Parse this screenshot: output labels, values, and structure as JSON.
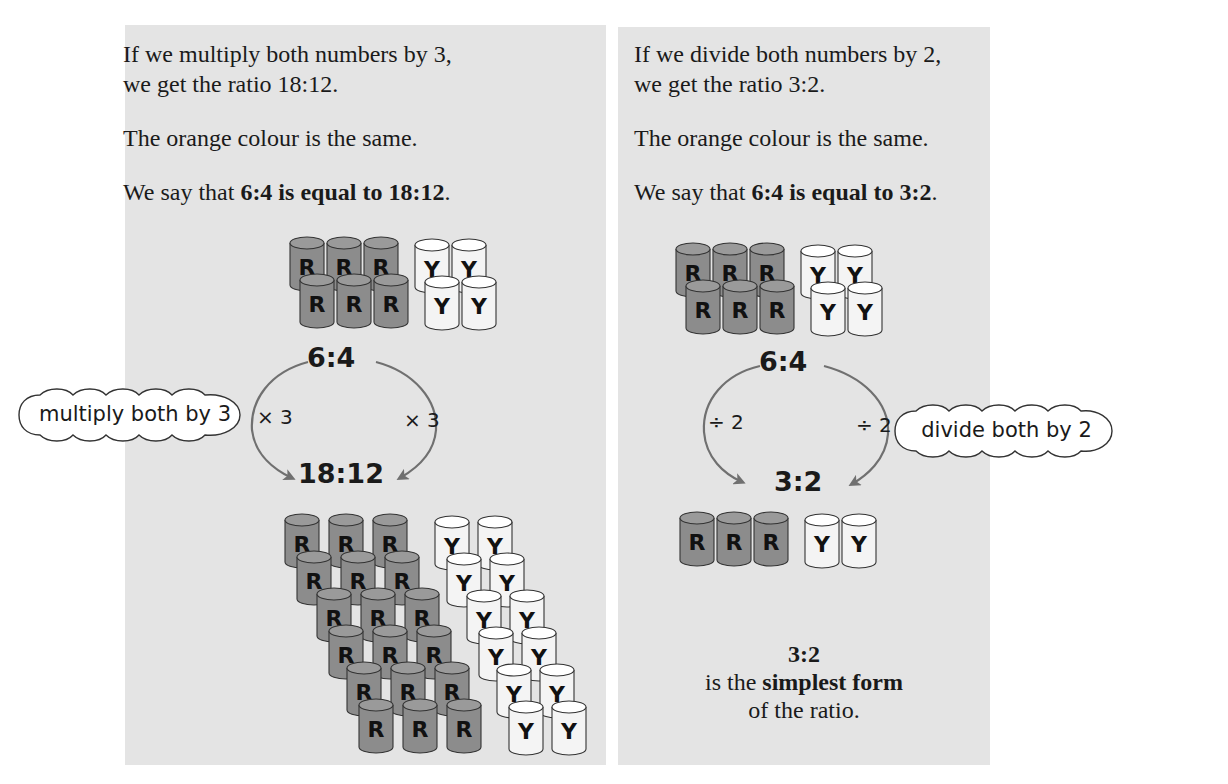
{
  "left": {
    "para1_line1": "If we multiply both numbers by 3,",
    "para1_line2": "we get the ratio 18:12.",
    "para2": "The orange colour is the same.",
    "para3_prefix": "We say that ",
    "para3_bold": "6:4 is equal to 18:12",
    "para3_suffix": ".",
    "top_ratio": "6:4",
    "bottom_ratio": "18:12",
    "op_left": "× 3",
    "op_right": "× 3",
    "cloud_label": "multiply both by 3",
    "top_group": {
      "red": 6,
      "yellow": 4
    },
    "bottom_group": {
      "red": 18,
      "yellow": 12
    }
  },
  "right": {
    "para1_line1": "If we divide both numbers by 2,",
    "para1_line2": "we get the ratio 3:2.",
    "para2": "The orange colour is the same.",
    "para3_prefix": "We say that ",
    "para3_bold": "6:4 is equal to 3:2",
    "para3_suffix": ".",
    "top_ratio": "6:4",
    "bottom_ratio": "3:2",
    "op_left": "÷ 2",
    "op_right": "÷ 2",
    "cloud_label": "divide both by 2",
    "top_group": {
      "red": 6,
      "yellow": 4
    },
    "bottom_group": {
      "red": 3,
      "yellow": 2
    },
    "conclusion_ratio": "3:2",
    "conclusion_line2_prefix": "is the ",
    "conclusion_line2_bold": "simplest form",
    "conclusion_line3": "of the ratio."
  },
  "drum_letters": {
    "red": "R",
    "yellow": "Y"
  },
  "colors": {
    "panel_bg": "#e4e4e4",
    "red_drum": "#8c8c8c",
    "yellow_drum": "#f4f4f4",
    "arrow": "#707070",
    "outline": "#333333"
  }
}
